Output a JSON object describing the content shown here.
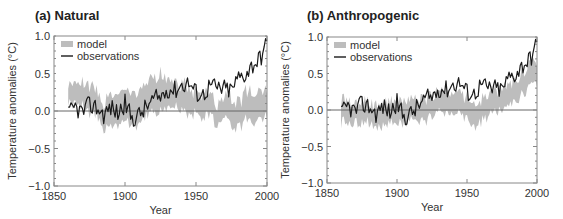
{
  "chart_data": [
    {
      "type": "line",
      "title": "(a) Natural",
      "xlabel": "Year",
      "ylabel": "Temperature anomalies (°C)",
      "xlim": [
        1850,
        2000
      ],
      "ylim": [
        -1.0,
        1.0
      ],
      "xticks": [
        1850,
        1900,
        1950,
        2000
      ],
      "yticks": [
        1.0,
        0.5,
        0.0,
        -0.5,
        -1.0
      ],
      "ytick_labels": [
        "1.0",
        "0.5",
        "0.0",
        "−0.5",
        "−1.0"
      ],
      "legend": {
        "position": "upper left",
        "entries": [
          "model",
          "observations"
        ]
      },
      "zero_line": true,
      "x": [
        1860,
        1865,
        1870,
        1875,
        1880,
        1885,
        1890,
        1895,
        1900,
        1905,
        1910,
        1915,
        1920,
        1925,
        1930,
        1935,
        1940,
        1945,
        1950,
        1955,
        1960,
        1965,
        1970,
        1975,
        1980,
        1985,
        1990,
        1995,
        2000
      ],
      "series": [
        {
          "name": "observations",
          "style": "line",
          "color": "#1a1a1a",
          "values": [
            -0.05,
            0.05,
            -0.02,
            0.08,
            0.05,
            -0.05,
            0.05,
            -0.03,
            0.1,
            -0.1,
            -0.05,
            0.05,
            0.15,
            0.18,
            0.3,
            0.28,
            0.35,
            0.38,
            0.25,
            0.22,
            0.35,
            0.3,
            0.3,
            0.28,
            0.45,
            0.5,
            0.62,
            0.7,
            0.9
          ]
        },
        {
          "name": "model",
          "style": "band",
          "color": "#bbbbbb",
          "lower": [
            0.12,
            0.15,
            0.12,
            0.0,
            0.0,
            -0.2,
            -0.2,
            -0.15,
            -0.05,
            -0.2,
            -0.1,
            -0.05,
            0.0,
            0.05,
            0.05,
            0.08,
            0.05,
            0.0,
            0.0,
            -0.05,
            -0.05,
            -0.15,
            0.0,
            -0.15,
            -0.2,
            -0.1,
            -0.1,
            -0.05,
            -0.05
          ],
          "upper": [
            0.3,
            0.35,
            0.35,
            0.3,
            0.25,
            0.05,
            0.15,
            0.2,
            0.3,
            0.15,
            0.3,
            0.3,
            0.4,
            0.45,
            0.35,
            0.35,
            0.3,
            0.3,
            0.2,
            0.2,
            0.15,
            0.05,
            0.2,
            0.15,
            0.05,
            0.2,
            0.2,
            0.25,
            0.25
          ]
        }
      ]
    },
    {
      "type": "line",
      "title": "(b) Anthropogenic",
      "xlabel": "Year",
      "ylabel": "Temperature anomalies (°C)",
      "xlim": [
        1850,
        2000
      ],
      "ylim": [
        -1.0,
        1.0
      ],
      "xticks": [
        1850,
        1900,
        1950,
        2000
      ],
      "yticks": [
        1.0,
        0.5,
        0.0,
        -0.5,
        -1.0
      ],
      "ytick_labels": [
        "1.0",
        "0.5",
        "0.0",
        "−0.5",
        "−1.0"
      ],
      "legend": {
        "position": "upper left",
        "entries": [
          "model",
          "observations"
        ]
      },
      "zero_line": true,
      "x": [
        1860,
        1865,
        1870,
        1875,
        1880,
        1885,
        1890,
        1895,
        1900,
        1905,
        1910,
        1915,
        1920,
        1925,
        1930,
        1935,
        1940,
        1945,
        1950,
        1955,
        1960,
        1965,
        1970,
        1975,
        1980,
        1985,
        1990,
        1995,
        2000
      ],
      "series": [
        {
          "name": "observations",
          "style": "line",
          "color": "#1a1a1a",
          "values": [
            -0.05,
            0.05,
            -0.02,
            0.08,
            0.05,
            -0.05,
            0.05,
            -0.03,
            0.1,
            -0.1,
            -0.05,
            0.05,
            0.15,
            0.18,
            0.3,
            0.28,
            0.35,
            0.38,
            0.25,
            0.22,
            0.35,
            0.3,
            0.3,
            0.28,
            0.45,
            0.5,
            0.62,
            0.7,
            0.9
          ]
        },
        {
          "name": "model",
          "style": "band",
          "color": "#bbbbbb",
          "lower": [
            -0.15,
            -0.15,
            -0.1,
            -0.15,
            -0.15,
            -0.2,
            -0.2,
            -0.15,
            -0.15,
            -0.15,
            -0.1,
            -0.15,
            -0.1,
            -0.05,
            0.0,
            0.0,
            0.0,
            0.0,
            -0.1,
            -0.2,
            -0.15,
            -0.05,
            0.0,
            0.05,
            0.1,
            0.15,
            0.25,
            0.35,
            0.4
          ]
        }
      ]
    }
  ],
  "panels": [
    {
      "title": "(a) Natural",
      "xlabel": "Year",
      "ylabel": "Temperature anomalies (°C)",
      "legend_model": "model",
      "legend_obs": "observations",
      "xtick_labels": [
        "1850",
        "1900",
        "1950",
        "2000"
      ],
      "ytick_labels": [
        "1.0",
        "0.5",
        "0.0",
        "−0.5",
        "−1.0"
      ]
    },
    {
      "title": "(b) Anthropogenic",
      "xlabel": "Year",
      "ylabel": "Temperature anomalies (°C)",
      "legend_model": "model",
      "legend_obs": "observations",
      "xtick_labels": [
        "1850",
        "1900",
        "1950",
        "2000"
      ],
      "ytick_labels": [
        "1.0",
        "0.5",
        "0.0",
        "−0.5",
        "−1.0"
      ]
    }
  ],
  "colors": {
    "model_band": "#bdbdbd",
    "observations": "#1a1a1a",
    "axis": "#888888",
    "zero_line": "#666666",
    "text": "#333333"
  }
}
